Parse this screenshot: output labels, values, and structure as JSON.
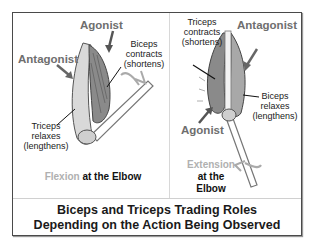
{
  "title": "Biceps and Triceps Trading Roles Depending on the Action Being Observed",
  "caption": {
    "line1": "Biceps and Triceps Trading Roles",
    "line2": "Depending on the Action Being Observed"
  },
  "panels": {
    "flexion": {
      "agonist_label": "Agonist",
      "antagonist_label": "Antagonist",
      "biceps_note": [
        "Biceps",
        "contracts",
        "(shortens)"
      ],
      "triceps_note": [
        "Triceps",
        "relaxes",
        "(lengthens)"
      ],
      "action_highlight": "Flexion",
      "action_rest": " at the Elbow"
    },
    "extension": {
      "agonist_label": "Agonist",
      "antagonist_label": "Antagonist",
      "triceps_note": [
        "Triceps",
        "contracts",
        "(shortens)"
      ],
      "biceps_note": [
        "Biceps",
        "relaxes",
        "(lengthens)"
      ],
      "action_highlight": "Extension",
      "action_line2": "at the",
      "action_line3": "Elbow"
    }
  },
  "colors": {
    "role_label": "#6e6e6e",
    "action_highlight": "#b0b0b0",
    "frame_border": "#4a4a4a",
    "text": "#1a1a1a"
  }
}
